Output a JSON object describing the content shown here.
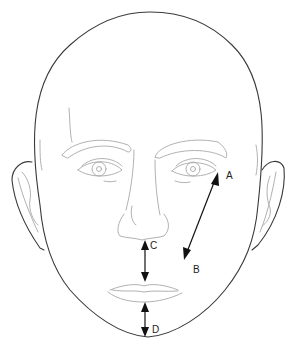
{
  "diagram": {
    "labels": [
      {
        "id": "A",
        "text": "A",
        "description": "arrow head at lateral canthus of left eye"
      },
      {
        "id": "B",
        "text": "B",
        "description": "arrow head near corner of mouth"
      },
      {
        "id": "C",
        "text": "C",
        "description": "arrow head at base of nose (subnasale)"
      },
      {
        "id": "D",
        "text": "D",
        "description": "arrow head at chin (menton)"
      }
    ],
    "measurements": [
      {
        "name": "eye-to-mouth-corner",
        "from": "A",
        "to": "B"
      },
      {
        "name": "nose-to-lip",
        "from": "C",
        "to": "upper-lip"
      },
      {
        "name": "lip-to-chin",
        "from": "lower-lip",
        "to": "D"
      }
    ],
    "colors": {
      "outline": "#3a3a3a",
      "features": "#a8a8a8",
      "arrows": "#111111",
      "background": "#ffffff"
    }
  }
}
